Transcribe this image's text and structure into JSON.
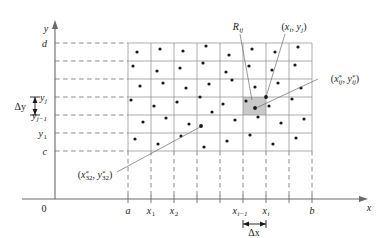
{
  "figure": {
    "axes": {
      "x_axis_label": "x",
      "y_axis_label": "y",
      "origin_label": "0"
    },
    "x_ticks": [
      {
        "label": "a",
        "sub": "",
        "x": 128
      },
      {
        "label": "x",
        "sub": "1",
        "x": 151
      },
      {
        "label": "x",
        "sub": "2",
        "x": 174
      },
      {
        "label": "",
        "sub": "",
        "x": 197
      },
      {
        "label": "",
        "sub": "",
        "x": 220
      },
      {
        "label": "x",
        "sub": "i−1",
        "x": 243
      },
      {
        "label": "x",
        "sub": "i",
        "x": 266
      },
      {
        "label": "",
        "sub": "",
        "x": 289
      },
      {
        "label": "b",
        "sub": "",
        "x": 312
      }
    ],
    "y_ticks": [
      {
        "label": "d",
        "sub": "",
        "y": 43
      },
      {
        "label": "",
        "sub": "",
        "y": 61
      },
      {
        "label": "",
        "sub": "",
        "y": 79
      },
      {
        "label": "y",
        "sub": "j",
        "y": 97
      },
      {
        "label": "y",
        "sub": "j−1",
        "y": 115
      },
      {
        "label": "y",
        "sub": "1",
        "y": 133
      },
      {
        "label": "c",
        "sub": "",
        "y": 151
      }
    ],
    "annotations": {
      "cell_label": "R",
      "cell_label_sub": "ij",
      "corner_point": "(x , y )",
      "corner_point_x": "x",
      "corner_point_x_sub": "i",
      "corner_point_y": "y",
      "corner_point_y_sub": "j",
      "sample_point_right": "(x* , y* )",
      "sample_point_right_x": "x",
      "sample_point_right_x_sub": "ij",
      "sample_point_right_y": "y",
      "sample_point_right_y_sub": "ij",
      "sample_point_lower": "(x* , y* )",
      "sample_point_lower_x": "x",
      "sample_point_lower_x_sub": "32",
      "sample_point_lower_y": "y",
      "sample_point_lower_y_sub": "32",
      "delta_x": "Δx",
      "delta_y": "Δy",
      "star_glyph": "*"
    },
    "colors": {
      "highlight_cell": "#c9c9c9",
      "grid": "#8a8a8a",
      "axis": "#6b6b6b",
      "dot": "#1a1a1a",
      "background": "#ffffff"
    },
    "sample_dots": [
      [
        137,
        52
      ],
      [
        160,
        49
      ],
      [
        183,
        51
      ],
      [
        206,
        46
      ],
      [
        229,
        55
      ],
      [
        252,
        49
      ],
      [
        275,
        52
      ],
      [
        298,
        47
      ],
      [
        133,
        66
      ],
      [
        157,
        71
      ],
      [
        180,
        68
      ],
      [
        203,
        63
      ],
      [
        226,
        72
      ],
      [
        249,
        66
      ],
      [
        272,
        70
      ],
      [
        295,
        65
      ],
      [
        140,
        86
      ],
      [
        163,
        83
      ],
      [
        186,
        88
      ],
      [
        209,
        84
      ],
      [
        232,
        80
      ],
      [
        255,
        87
      ],
      [
        278,
        83
      ],
      [
        301,
        88
      ],
      [
        131,
        100
      ],
      [
        154,
        106
      ],
      [
        177,
        102
      ],
      [
        200,
        97
      ],
      [
        223,
        104
      ],
      [
        246,
        101
      ],
      [
        269,
        106
      ],
      [
        292,
        99
      ],
      [
        143,
        122
      ],
      [
        166,
        118
      ],
      [
        189,
        124
      ],
      [
        212,
        112
      ],
      [
        235,
        120
      ],
      [
        258,
        117
      ],
      [
        281,
        123
      ],
      [
        304,
        119
      ],
      [
        135,
        139
      ],
      [
        158,
        144
      ],
      [
        181,
        136
      ],
      [
        204,
        147
      ],
      [
        227,
        141
      ],
      [
        250,
        135
      ],
      [
        273,
        144
      ],
      [
        296,
        138
      ]
    ]
  }
}
